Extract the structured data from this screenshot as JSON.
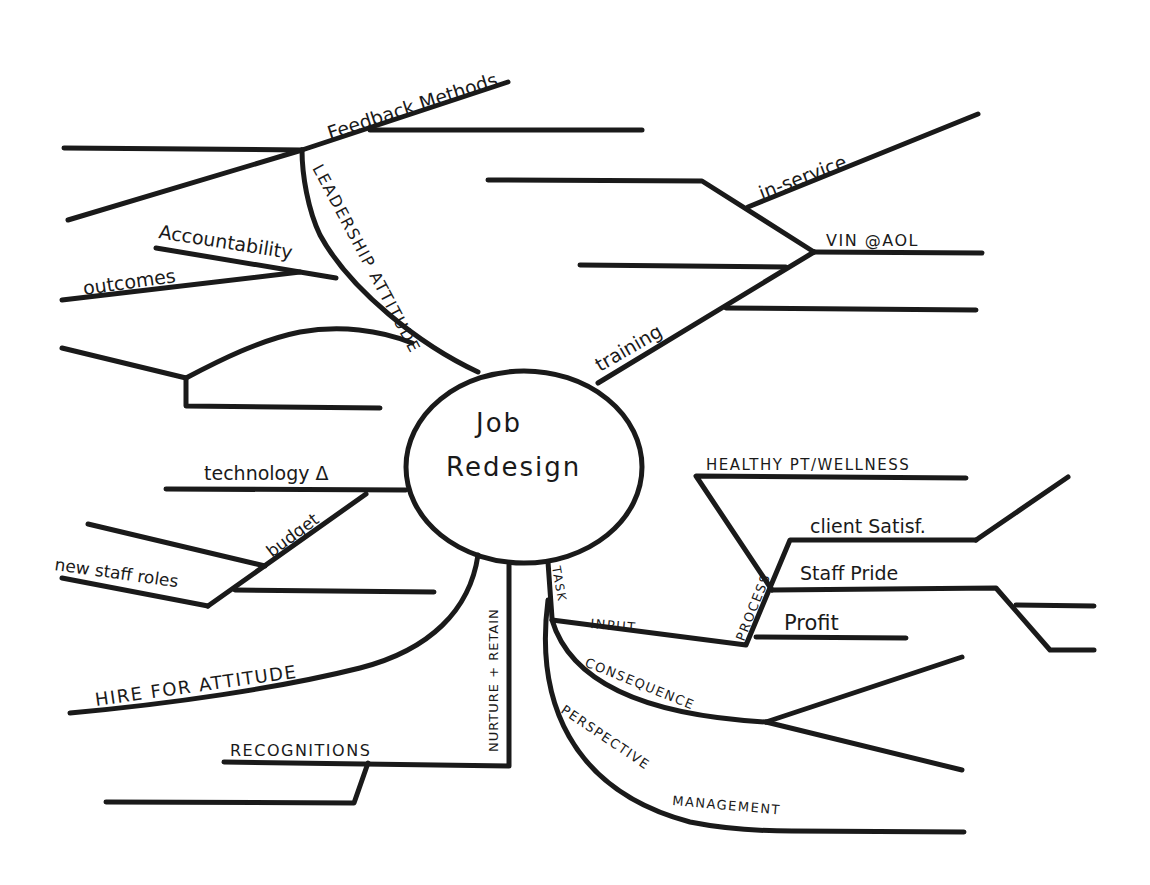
{
  "diagram": {
    "type": "mind-map",
    "center": {
      "line1": "Job",
      "line2": "Redesign"
    },
    "branches": {
      "leadership_attitude": {
        "label": "LEADERSHIP ATTITUDE",
        "children": {
          "feedback_methods": "Feedback Methods",
          "accountability": "Accountability",
          "outcomes": "outcomes"
        }
      },
      "training": {
        "label": "training",
        "children": {
          "in_service": "in-service",
          "vin_aol": "VIN @AOL"
        }
      },
      "budget": {
        "label": "budget",
        "children": {
          "technology": "technology Δ",
          "new_staff_roles": "new staff roles"
        }
      },
      "hire_for_attitude": {
        "label": "HIRE FOR ATTITUDE"
      },
      "nurture_retain": {
        "label": "NURTURE + RETAIN",
        "children": {
          "recognitions": "RECOGNITIONS"
        }
      },
      "task": {
        "label": "TASK",
        "children": {
          "input": "INPUT",
          "process": "PROCESS",
          "consequence": "CONSEQUENCE",
          "perspective_management": "PERSPECTIVE MANAGEMENT"
        },
        "process_children": {
          "healthy_pt": "HEALTHY PT/WELLNESS",
          "client_satisf": "client Satisf.",
          "staff_pride": "Staff Pride",
          "profit": "Profit"
        }
      }
    }
  }
}
